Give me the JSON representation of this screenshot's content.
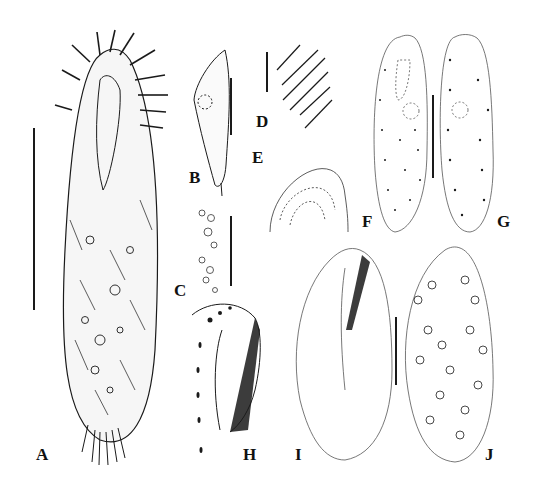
{
  "figure": {
    "panels": [
      {
        "id": "A",
        "label": "A",
        "description": "ciliate cell, ventral view, with cirri and cortical granules"
      },
      {
        "id": "B",
        "label": "B",
        "description": "lateral view of cell, slender curved body"
      },
      {
        "id": "C",
        "label": "C",
        "description": "detail of cortical granules and cytoplasmic inclusions"
      },
      {
        "id": "D",
        "label": "D",
        "description": "detail of cirri with cortical granules"
      },
      {
        "id": "E",
        "label": "E",
        "description": "anterior end detail with granules"
      },
      {
        "id": "F",
        "label": "F",
        "description": "ventral view, infraciliature dots"
      },
      {
        "id": "G",
        "label": "G",
        "description": "dorsal view, infraciliature dot rows"
      },
      {
        "id": "H",
        "label": "H",
        "description": "oral apparatus with adoral membranelles"
      },
      {
        "id": "I",
        "label": "I",
        "description": "ventral infraciliature after protargol"
      },
      {
        "id": "J",
        "label": "J",
        "description": "dorsal view with macronuclear nodules"
      }
    ],
    "colors": {
      "ink": "#1a1a1a",
      "background": "#ffffff"
    }
  }
}
